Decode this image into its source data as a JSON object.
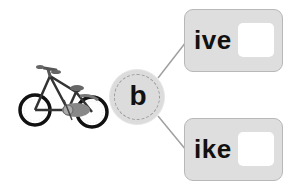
{
  "exercise": {
    "image": {
      "label": "bicycle",
      "icon": "bicycle-icon"
    },
    "hub_letter": "b",
    "options": [
      {
        "suffix": "ive",
        "answer": ""
      },
      {
        "suffix": "ike",
        "answer": ""
      }
    ]
  },
  "colors": {
    "card_fill": "#dedede",
    "card_border": "#b8b8b8",
    "hub_fill": "#dcdcdc",
    "connector": "#9a9a9a",
    "text": "#111111"
  }
}
